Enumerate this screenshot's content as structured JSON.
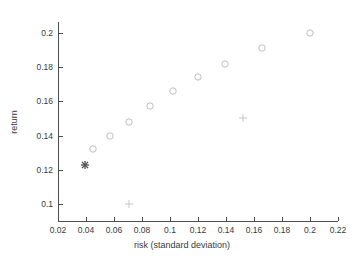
{
  "chart_data": {
    "type": "scatter",
    "title": "",
    "xlabel": "risk (standard deviation)",
    "ylabel": "return",
    "xlim": [
      0.02,
      0.22
    ],
    "ylim": [
      0.09,
      0.207
    ],
    "grid": false,
    "legend": "none",
    "xticks": [
      "0.02",
      "0.04",
      "0.06",
      "0.08",
      "0.1",
      "0.12",
      "0.14",
      "0.16",
      "0.18",
      "0.2",
      "0.22"
    ],
    "xtick_values": [
      0.02,
      0.04,
      0.06,
      0.08,
      0.1,
      0.12,
      0.14,
      0.16,
      0.18,
      0.2,
      0.22
    ],
    "yticks": [
      "0.1",
      "0.12",
      "0.14",
      "0.16",
      "0.18",
      "0.2"
    ],
    "ytick_values": [
      0.1,
      0.12,
      0.14,
      0.16,
      0.18,
      0.2
    ],
    "series": [
      {
        "name": "efficient-frontier-portfolios",
        "marker": "circle",
        "color": "#bfbfbf",
        "points": [
          {
            "x": 0.045,
            "y": 0.132
          },
          {
            "x": 0.057,
            "y": 0.14
          },
          {
            "x": 0.071,
            "y": 0.148
          },
          {
            "x": 0.086,
            "y": 0.157
          },
          {
            "x": 0.102,
            "y": 0.166
          },
          {
            "x": 0.12,
            "y": 0.174
          },
          {
            "x": 0.139,
            "y": 0.182
          },
          {
            "x": 0.166,
            "y": 0.191
          },
          {
            "x": 0.2,
            "y": 0.2
          }
        ]
      },
      {
        "name": "minimum-variance-portfolio",
        "marker": "asterisk",
        "color": "#4d4d4d",
        "points": [
          {
            "x": 0.039,
            "y": 0.123
          }
        ]
      },
      {
        "name": "individual-assets",
        "marker": "plus",
        "color": "#c6c6c6",
        "points": [
          {
            "x": 0.071,
            "y": 0.1
          },
          {
            "x": 0.152,
            "y": 0.15
          }
        ]
      }
    ]
  },
  "figure": {
    "background": "#ffffff",
    "axis_color": "#4d4d4d",
    "text_color": "#3a3a3a"
  }
}
